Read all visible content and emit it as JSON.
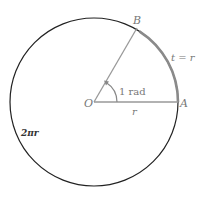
{
  "diagram": {
    "labels": {
      "point_b": "B",
      "point_a": "A",
      "center": "O",
      "arc_length": "t = r",
      "angle": "1 rad",
      "radius": "r",
      "circumference": "2πr"
    },
    "colors": {
      "circle": "#222222",
      "radius_lines": "#999999",
      "arc": "#888888",
      "labels": "#777777"
    },
    "geometry": {
      "center": [
        94,
        102
      ],
      "radius": 84,
      "angle_rad": 1
    }
  }
}
